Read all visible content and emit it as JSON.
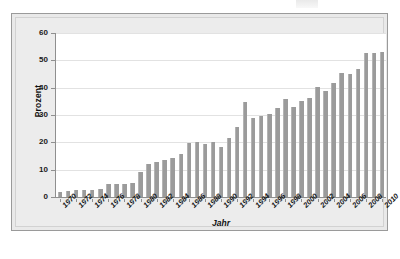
{
  "chart_data": {
    "type": "bar",
    "title": "",
    "xlabel": "Jahr",
    "ylabel": "Prozent",
    "ylim": [
      0,
      60
    ],
    "yticks": [
      0,
      10,
      20,
      30,
      40,
      50,
      60
    ],
    "grid": true,
    "legend": "none",
    "bar_color": "#9b9b9b",
    "plot_background": "#ffffff",
    "frame_background": "#e9e9e9",
    "label_interval_years": 2,
    "categories": [
      "1970",
      "1971",
      "1972",
      "1973",
      "1974",
      "1975",
      "1976",
      "1977",
      "1978",
      "1979",
      "1980",
      "1981",
      "1982",
      "1983",
      "1984",
      "1985",
      "1986",
      "1987",
      "1988",
      "1989",
      "1990",
      "1991",
      "1992",
      "1993",
      "1994",
      "1995",
      "1996",
      "1997",
      "1998",
      "1999",
      "2000",
      "2001",
      "2002",
      "2003",
      "2004",
      "2005",
      "2006",
      "2007",
      "2008",
      "2009",
      "2010"
    ],
    "tick_labels": [
      "1970",
      "1972",
      "1974",
      "1976",
      "1978",
      "1980",
      "1982",
      "1984",
      "1986",
      "1988",
      "1990",
      "1992",
      "1994",
      "1996",
      "1998",
      "2000",
      "2002",
      "2004",
      "2006",
      "2008",
      "2010"
    ],
    "values": [
      1.7,
      2.3,
      2.6,
      2.6,
      2.7,
      2.9,
      4.9,
      4.7,
      4.7,
      5.0,
      9.0,
      12.2,
      12.9,
      13.6,
      14.2,
      15.9,
      19.7,
      20.3,
      19.4,
      20.0,
      18.3,
      21.5,
      25.5,
      34.9,
      28.8,
      29.6,
      30.4,
      32.6,
      35.9,
      33.1,
      35.2,
      36.1,
      40.2,
      38.7,
      41.6,
      45.5,
      45.0,
      46.7,
      52.6,
      52.6,
      53.0
    ]
  }
}
